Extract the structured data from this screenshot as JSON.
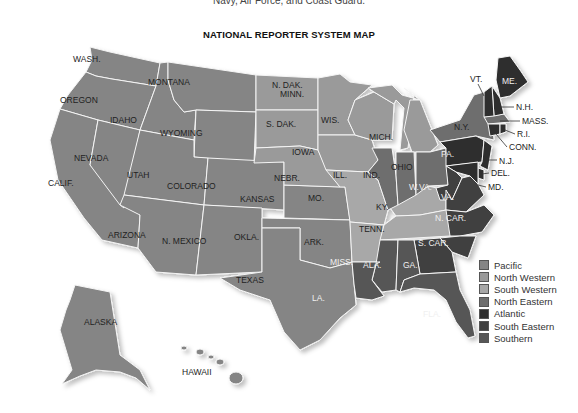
{
  "caption": "Navy, Air Force, and Coast Guard.",
  "title": "NATIONAL REPORTER SYSTEM MAP",
  "legend": [
    {
      "label": "Pacific",
      "color": "#858585"
    },
    {
      "label": "North Western",
      "color": "#9a9a9a"
    },
    {
      "label": "South Western",
      "color": "#a8a8a8"
    },
    {
      "label": "North Eastern",
      "color": "#6e6e6e"
    },
    {
      "label": "Atlantic",
      "color": "#2f2f2f"
    },
    {
      "label": "South Eastern",
      "color": "#404040"
    },
    {
      "label": "Southern",
      "color": "#575757"
    }
  ],
  "states": {
    "wash": "WASH.",
    "oregon": "OREGON",
    "calif": "CALIF.",
    "nevada": "NEVADA",
    "idaho": "IDAHO",
    "montana": "MONTANA",
    "wyoming": "WYOMING",
    "utah": "UTAH",
    "colorado": "COLORADO",
    "arizona": "ARIZONA",
    "nmexico": "N. MEXICO",
    "ndak": "N. DAK.",
    "sdak": "S. DAK.",
    "nebr": "NEBR.",
    "kansas": "KANSAS",
    "okla": "OKLA.",
    "texas": "TEXAS",
    "minn": "MINN.",
    "iowa": "IOWA",
    "mo": "MO.",
    "ark": "ARK.",
    "la": "LA.",
    "wis": "WIS.",
    "ill": "ILL.",
    "mich": "MICH.",
    "ind": "IND.",
    "ohio": "OHIO",
    "ky": "KY.",
    "tenn": "TENN.",
    "miss": "MISS.",
    "ala": "ALA.",
    "ga": "GA.",
    "fla": "FLA.",
    "scar": "S. CAR.",
    "ncar": "N. CAR.",
    "va": "VA.",
    "wva": "W.VA.",
    "md": "MD.",
    "del": "DEL.",
    "nj": "N.J.",
    "pa": "PA.",
    "ny": "N.Y.",
    "conn": "CONN.",
    "ri": "R.I.",
    "mass": "MASS.",
    "nh": "N.H.",
    "vt": "VT.",
    "me": "ME.",
    "alaska": "ALASKA",
    "hawaii": "HAWAII"
  }
}
